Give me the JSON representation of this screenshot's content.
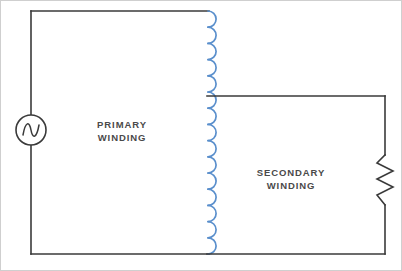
{
  "diagram": {
    "type": "transformer-circuit-schematic",
    "background_color": "#ffffff",
    "wire_color": "#3a3a3a",
    "coil_color": "#5a8fcc",
    "text_color": "#4a4a4a",
    "frame_color": "#c9c9c9"
  },
  "labels": {
    "primary": {
      "line1": "PRIMARY",
      "line2": "WINDING"
    },
    "secondary": {
      "line1": "SECONDARY",
      "line2": "WINDING"
    }
  },
  "components": {
    "ac_source": {
      "icon": "ac-source-sine-icon",
      "center_x": 31,
      "center_y": 130,
      "radius": 15
    },
    "transformer_coil": {
      "icon": "inductor-coil-icon",
      "x": 208,
      "y_top": 11,
      "y_bottom": 254,
      "arc_count": 15,
      "arc_radius": 8
    },
    "resistor": {
      "icon": "resistor-zigzag-icon",
      "x": 385,
      "y_top": 155,
      "y_bottom": 205,
      "peaks": 6
    }
  },
  "wires": {
    "primary_top": "31,11 to 208,11",
    "primary_left_upper": "31,11 to 31,115",
    "primary_left_lower": "31,145 to 31,254",
    "primary_bottom": "31,254 to 208,254",
    "secondary_top": "208,96 to 385,96",
    "secondary_right_upper": "385,96 to 385,155",
    "secondary_right_lower": "385,205 to 385,254",
    "secondary_bottom": "208,254 to 385,254"
  }
}
